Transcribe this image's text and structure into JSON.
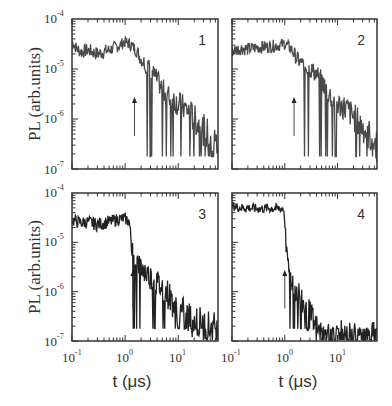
{
  "chart_data": [
    {
      "type": "line",
      "panel": "1",
      "title": "",
      "xlabel": "t (μs)",
      "ylabel": "PL (arb.units)",
      "xscale": "log",
      "yscale": "log",
      "xlim": [
        0.1,
        56
      ],
      "ylim": [
        1e-07,
        0.0001
      ],
      "arrow_at_t": 1.5,
      "x": [
        0.1,
        0.12,
        0.15,
        0.2,
        0.3,
        0.5,
        0.8,
        1.0,
        1.3,
        1.6,
        2.0,
        2.5,
        3.0,
        4.0,
        5.0,
        6.0,
        8.0,
        10,
        15,
        20,
        30,
        45,
        56
      ],
      "y": [
        3.5e-05,
        2.6e-05,
        2.2e-05,
        2.4e-05,
        2e-05,
        2.4e-05,
        3e-05,
        3.5e-05,
        3e-05,
        2.4e-05,
        1.6e-05,
        1.2e-05,
        1e-05,
        6e-06,
        4e-06,
        3e-06,
        2.5e-06,
        2e-06,
        1.5e-06,
        1e-06,
        6e-07,
        4e-07,
        3e-07
      ]
    },
    {
      "type": "line",
      "panel": "2",
      "title": "",
      "xlabel": "",
      "ylabel": "",
      "xscale": "log",
      "yscale": "log",
      "xlim": [
        0.1,
        56
      ],
      "ylim": [
        1e-07,
        0.0001
      ],
      "arrow_at_t": 1.5,
      "x": [
        0.1,
        0.15,
        0.2,
        0.3,
        0.5,
        0.8,
        1.0,
        1.3,
        1.6,
        2.0,
        2.5,
        3.0,
        4.0,
        5.0,
        6.0,
        8.0,
        10,
        15,
        20,
        30,
        45,
        56
      ],
      "y": [
        2.3e-05,
        2.6e-05,
        2.5e-05,
        2.7e-05,
        2.8e-05,
        3e-05,
        3.2e-05,
        2.6e-05,
        1.8e-05,
        1.3e-05,
        1.1e-05,
        1e-05,
        8e-06,
        6e-06,
        4e-06,
        2.5e-06,
        2e-06,
        1.6e-06,
        1.1e-06,
        7e-07,
        4e-07,
        3e-07
      ]
    },
    {
      "type": "line",
      "panel": "3",
      "title": "",
      "xlabel": "t (μs)",
      "ylabel": "PL (arb.units)",
      "xscale": "log",
      "yscale": "log",
      "xlim": [
        0.1,
        56
      ],
      "ylim": [
        1e-07,
        0.0001
      ],
      "arrow_at_t": 1.4,
      "x": [
        0.1,
        0.15,
        0.2,
        0.3,
        0.5,
        0.8,
        1.0,
        1.2,
        1.3,
        1.5,
        2.0,
        3.0,
        4.0,
        6.0,
        8.0,
        10,
        15,
        20,
        30,
        45,
        56
      ],
      "y": [
        2.8e-05,
        2.5e-05,
        2.6e-05,
        2.3e-05,
        2.6e-05,
        3e-05,
        3e-05,
        2.6e-05,
        1e-05,
        5e-06,
        3e-06,
        2e-06,
        1.5e-06,
        1e-06,
        6e-07,
        4e-07,
        3e-07,
        2.5e-07,
        2e-07,
        1.7e-07,
        1.5e-07
      ]
    },
    {
      "type": "line",
      "panel": "4",
      "title": "",
      "xlabel": "t (μs)",
      "ylabel": "",
      "xscale": "log",
      "yscale": "log",
      "xlim": [
        0.1,
        56
      ],
      "ylim": [
        1e-07,
        0.0001
      ],
      "arrow_at_t": 1.0,
      "x": [
        0.1,
        0.15,
        0.2,
        0.3,
        0.5,
        0.8,
        0.95,
        1.0,
        1.1,
        1.3,
        1.6,
        2.0,
        2.5,
        3.0,
        4.0,
        5.0,
        6.0,
        10,
        20,
        30,
        56
      ],
      "y": [
        5.5e-05,
        5e-05,
        5e-05,
        4.8e-05,
        4.9e-05,
        4.8e-05,
        4.8e-05,
        3e-05,
        4e-06,
        2e-06,
        1.2e-06,
        8e-07,
        4e-07,
        3e-07,
        1.5e-07,
        1.1e-07,
        1e-07,
        1e-07,
        1e-07,
        1e-07,
        1e-07
      ]
    }
  ],
  "axes": {
    "y_ticks": [
      {
        "base": "10",
        "exp": "-4"
      },
      {
        "base": "10",
        "exp": "-5"
      },
      {
        "base": "10",
        "exp": "-6"
      },
      {
        "base": "10",
        "exp": "-7"
      }
    ],
    "x_ticks": [
      {
        "base": "10",
        "exp": "-1"
      },
      {
        "base": "10",
        "exp": "0"
      },
      {
        "base": "10",
        "exp": "1"
      }
    ],
    "ylabel": "PL (arb.units)",
    "xlabel": "t (μs)"
  },
  "panels": [
    {
      "label": "1"
    },
    {
      "label": "2"
    },
    {
      "label": "3"
    },
    {
      "label": "4"
    }
  ],
  "colors": {
    "line": "#4a4a4a",
    "line_dark": "#222222",
    "axis": "#333333"
  }
}
